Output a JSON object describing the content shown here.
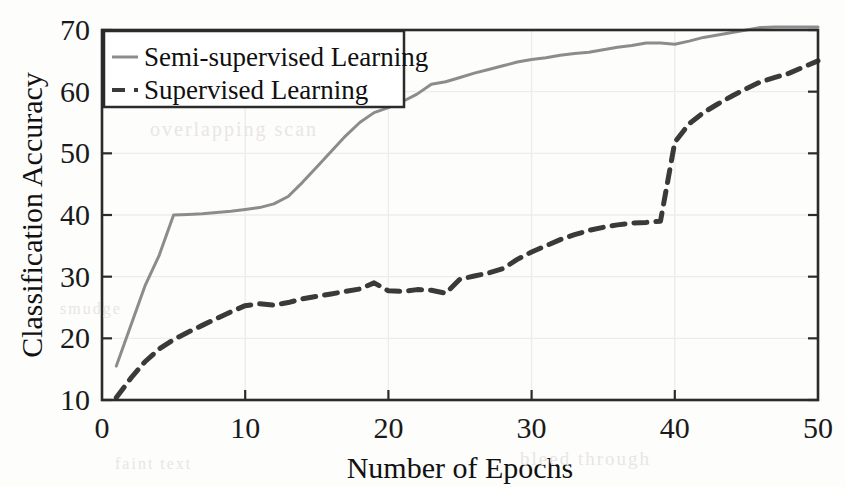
{
  "figure": {
    "background_color": "#fdfdfc",
    "frame_color": "#2b2b2b",
    "grid_color": "#ededed",
    "scan_artifacts": {
      "ghost_a": "overlapping scan",
      "ghost_b": "bleed through",
      "ghost_c": "faint text",
      "ghost_d": "smudge"
    }
  },
  "chart_data": {
    "type": "line",
    "title": "",
    "xlabel": "Number of Epochs",
    "ylabel": "Classification Accuracy",
    "xlim": [
      0,
      50
    ],
    "ylim": [
      10,
      70
    ],
    "xticks": [
      0,
      10,
      20,
      30,
      40,
      50
    ],
    "yticks": [
      10,
      20,
      30,
      40,
      50,
      60,
      70
    ],
    "xtick_labels": [
      "0",
      "10",
      "20",
      "30",
      "40",
      "50"
    ],
    "ytick_labels": [
      "10",
      "20",
      "30",
      "40",
      "50",
      "60",
      "70"
    ],
    "grid": true,
    "legend_position": "top-left",
    "x": [
      1,
      2,
      3,
      4,
      5,
      6,
      7,
      8,
      9,
      10,
      11,
      12,
      13,
      14,
      15,
      16,
      17,
      18,
      19,
      20,
      21,
      22,
      23,
      24,
      25,
      26,
      27,
      28,
      29,
      30,
      31,
      32,
      33,
      34,
      35,
      36,
      37,
      38,
      39,
      40,
      41,
      42,
      43,
      44,
      45,
      46,
      47,
      48,
      49,
      50
    ],
    "series": [
      {
        "name": "Semi-supervised Learning",
        "style": "solid",
        "color": "#8c8c8c",
        "linewidth": 3,
        "values": [
          15.5,
          22.0,
          28.5,
          33.5,
          40.0,
          40.1,
          40.2,
          40.4,
          40.6,
          40.9,
          41.2,
          41.8,
          43.0,
          45.3,
          47.8,
          50.3,
          52.8,
          55.0,
          56.6,
          57.4,
          58.4,
          59.6,
          61.2,
          61.6,
          62.3,
          63.0,
          63.6,
          64.2,
          64.8,
          65.2,
          65.5,
          65.9,
          66.2,
          66.4,
          66.8,
          67.2,
          67.5,
          67.9,
          67.9,
          67.7,
          68.2,
          68.8,
          69.2,
          69.6,
          70.0,
          70.4,
          70.5,
          70.5,
          70.5,
          70.5
        ]
      },
      {
        "name": "Supervised Learning",
        "style": "dashed",
        "color": "#3a3a3a",
        "linewidth": 5,
        "values": [
          10.4,
          13.5,
          16.2,
          18.3,
          19.8,
          21.0,
          22.1,
          23.2,
          24.3,
          25.3,
          25.6,
          25.4,
          25.8,
          26.4,
          26.8,
          27.2,
          27.6,
          28.0,
          29.0,
          27.7,
          27.6,
          27.9,
          27.8,
          27.3,
          29.6,
          30.1,
          30.6,
          31.3,
          32.8,
          34.0,
          35.0,
          36.0,
          36.8,
          37.5,
          38.0,
          38.4,
          38.7,
          38.8,
          39.0,
          51.8,
          54.8,
          56.6,
          58.0,
          59.3,
          60.5,
          61.6,
          62.3,
          63.0,
          64.0,
          65.0
        ]
      }
    ]
  }
}
